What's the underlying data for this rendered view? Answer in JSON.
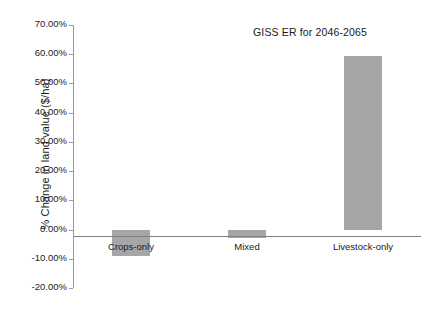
{
  "chart_data": {
    "type": "bar",
    "title": "GISS ER for 2046-2065",
    "xlabel": "",
    "ylabel": "% Change in land value ($/ha)",
    "categories": [
      "Crops-only",
      "Mixed",
      "Livestock-only"
    ],
    "values": [
      -9.0,
      -3.0,
      59.5
    ],
    "value_labels": [
      "-9.00%",
      "-3.00%",
      "59.50%"
    ],
    "series": [
      {
        "name": "GISS ER for 2046-2065",
        "values": [
          -9.0,
          -3.0,
          59.5
        ]
      }
    ],
    "ylim": [
      -20,
      70
    ],
    "ytick_values": [
      70,
      60,
      50,
      40,
      30,
      20,
      10,
      0,
      -10,
      -20
    ],
    "ytick_labels": [
      "70.00%",
      "60.00%",
      "50.00%",
      "40.00%",
      "30.00%",
      "20.00%",
      "10.00%",
      "0.00%",
      "-10.00%",
      "-20.00%"
    ],
    "grid": false,
    "legend": false,
    "legend_position": "none",
    "bar_color": "#a6a6a6",
    "axis_color": "#9a9a9a",
    "zero_line_color": "#808080",
    "background_color": "#ffffff",
    "text_color": "#1a1a1a"
  }
}
